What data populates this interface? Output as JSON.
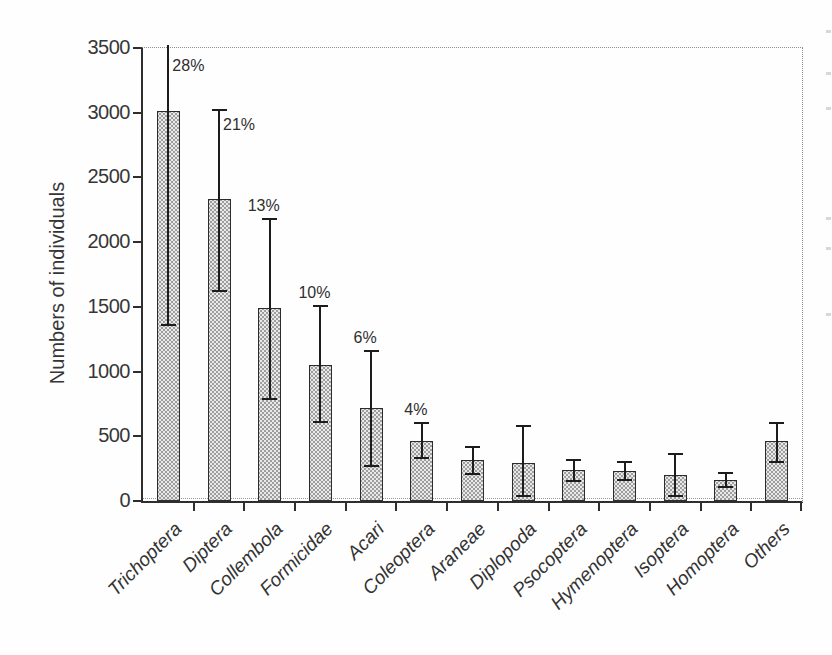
{
  "chart_data": {
    "type": "bar",
    "title": "",
    "xlabel": "",
    "ylabel": "Numbers of individuals",
    "ylim": [
      0,
      3500
    ],
    "yticks": [
      0,
      500,
      1000,
      1500,
      2000,
      2500,
      3000,
      3500
    ],
    "legend": "none",
    "grid": "dotted frame line at top (y=3500) and right edge only",
    "bar_style": "light gray stipple-dot pattern with dark outline and error bars",
    "categories": [
      "Trichoptera",
      "Diptera",
      "Collembola",
      "Formicidae",
      "Acari",
      "Coleoptera",
      "Araneae",
      "Diplopoda",
      "Psocoptera",
      "Hymenoptera",
      "Isoptera",
      "Homoptera",
      "Others"
    ],
    "values": [
      3010,
      2330,
      1490,
      1050,
      720,
      465,
      315,
      295,
      240,
      235,
      200,
      160,
      460
    ],
    "error_low": [
      1360,
      1620,
      790,
      610,
      270,
      335,
      210,
      40,
      155,
      160,
      40,
      110,
      300
    ],
    "error_high": [
      3500,
      3020,
      2180,
      1510,
      1160,
      600,
      420,
      580,
      315,
      300,
      360,
      220,
      600
    ],
    "error_high_clipped": [
      true,
      false,
      false,
      false,
      false,
      false,
      false,
      false,
      false,
      false,
      false,
      false,
      false
    ],
    "percent_labels": [
      "28%",
      "21%",
      "13%",
      "10%",
      "6%",
      "4%",
      "",
      "",
      "",
      "",
      "",
      "",
      ""
    ]
  },
  "style_colors": {
    "axis": "#2e2e2e",
    "text": "#363636",
    "bar_fill": "#e9e9e9",
    "bar_dots": "#6e6e6e",
    "bar_border": "#2c2c2c",
    "error_bar": "#1c1c1c",
    "dotted_frame": "#8f8f8f"
  }
}
